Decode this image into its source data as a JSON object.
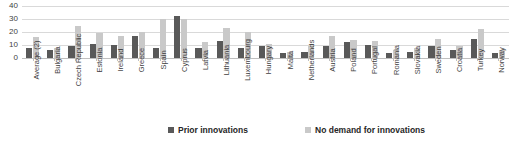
{
  "chart_data": {
    "type": "bar",
    "title": "",
    "subtitle": "",
    "xlabel": "",
    "ylabel": "",
    "ylim": [
      0,
      40
    ],
    "yticks": [
      0,
      10,
      20,
      30,
      40
    ],
    "grid": true,
    "legend_position": "bottom",
    "colors": {
      "series_prior_innovations": "#595959",
      "series_no_demand": "#c9c9c9",
      "gridline": "#d9d9d9",
      "axis": "#bfbfbf",
      "text": "#3f3f3f"
    },
    "categories": [
      "Average (2)",
      "Bulgaria",
      "Czech Republic",
      "Estonia",
      "Ireland",
      "Greece",
      "Spain",
      "Cyprus",
      "Latvia",
      "Lithuania",
      "Luxembourg",
      "Hungary",
      "Malta",
      "Netherlands",
      "Austria",
      "Poland",
      "Portugal",
      "Romania",
      "Slovakia",
      "Sweden",
      "Croatia",
      "Turkey",
      "Norway"
    ],
    "series": [
      {
        "name": "Prior innovations",
        "color": "#595959",
        "values": [
          8,
          6,
          9,
          11,
          10,
          17,
          8,
          32,
          8,
          13,
          8,
          9,
          4,
          5,
          9,
          12,
          10,
          4,
          5,
          9,
          6,
          15,
          4
        ]
      },
      {
        "name": "No demand for innovations",
        "color": "#c9c9c9",
        "values": [
          16,
          8,
          25,
          19,
          17,
          20,
          30,
          30,
          12,
          23,
          20,
          11,
          5,
          9,
          17,
          14,
          13,
          6,
          8,
          15,
          9,
          22,
          6
        ]
      }
    ]
  },
  "legend": {
    "entries": [
      {
        "label": "Prior innovations",
        "swatch": "series-prior-innovations-swatch"
      },
      {
        "label": "No demand for innovations",
        "swatch": "series-no-demand-swatch"
      }
    ]
  },
  "axis": {
    "y_tick_labels": [
      "40",
      "30",
      "20",
      "10",
      "0"
    ]
  }
}
